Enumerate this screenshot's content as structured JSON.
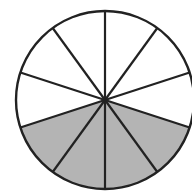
{
  "diagram": {
    "type": "fraction-circle",
    "total_slices": 10,
    "shaded_slices": 4,
    "shaded_indices": [
      3,
      4,
      5,
      6
    ],
    "fraction_shaded": "4/10",
    "center": [
      105,
      100
    ],
    "radius": 89,
    "colors": {
      "shaded": "#b4b4b4",
      "unshaded": "#ffffff",
      "stroke": "#222222"
    }
  }
}
